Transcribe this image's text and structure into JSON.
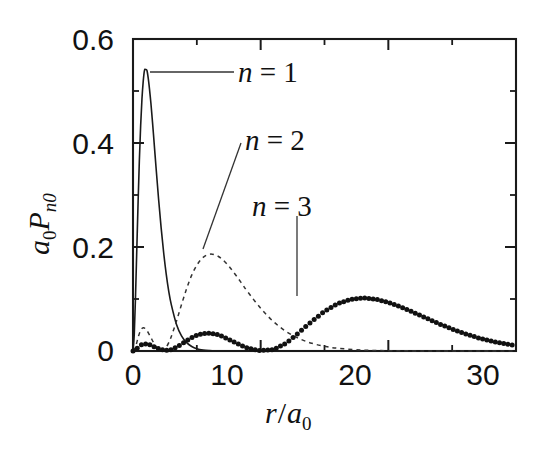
{
  "figure": {
    "kind": "scientific-plot",
    "background": "#ffffff",
    "ink_color": "#111111"
  },
  "chart_data": {
    "type": "line",
    "title": "",
    "subtitle": "",
    "xlabel": "r/a_0",
    "xlabel_parts": {
      "var": "r",
      "slash": "/",
      "base": "a",
      "sub": "0"
    },
    "ylabel": "a_0 P_n0",
    "ylabel_parts": {
      "base": "a",
      "base_sub": "0",
      "p": "P",
      "p_sub": "n0"
    },
    "xlim": [
      0,
      30
    ],
    "ylim": [
      0,
      0.6
    ],
    "grid": false,
    "legend_position": "inline-annotations",
    "x_major_ticks": [
      0,
      10,
      20,
      30
    ],
    "x_major_tick_labels": [
      "0",
      "10",
      "20",
      "30"
    ],
    "x_minor_ticks": [
      5,
      15,
      25
    ],
    "y_major_ticks": [
      0,
      0.2,
      0.4,
      0.6
    ],
    "y_major_tick_labels": [
      "0",
      "0.2",
      "0.4",
      "0.6"
    ],
    "y_minor_ticks": [
      0.1,
      0.3,
      0.5
    ],
    "annotations": [
      {
        "text": "n = 1",
        "n": 1,
        "leader": "horizontal",
        "points_to_r": 1.05,
        "points_to_value": 0.535
      },
      {
        "text": "n = 2",
        "n": 2,
        "leader": "diagonal",
        "points_to_r": 5.4,
        "points_to_value": 0.185
      },
      {
        "text": "n = 3",
        "n": 3,
        "leader": "vertical",
        "points_to_r": 12.8,
        "points_to_value": 0.105
      }
    ],
    "series": [
      {
        "name": "n = 1",
        "label": "n = 1",
        "style": "solid",
        "peak_r": 1.0,
        "peak_value": 0.541,
        "x": [
          0,
          0.1,
          0.2,
          0.3,
          0.4,
          0.5,
          0.6,
          0.7,
          0.8,
          0.9,
          1.0,
          1.1,
          1.2,
          1.3,
          1.4,
          1.5,
          1.6,
          1.8,
          2.0,
          2.2,
          2.4,
          2.6,
          2.8,
          3.0,
          3.4,
          3.8,
          4.2,
          4.6,
          5.0,
          5.5,
          6.0,
          6.5,
          7.0,
          8.0,
          9.0,
          10.0,
          12.0,
          15.0,
          20.0,
          25.0,
          30.0
        ],
        "y": [
          0.0,
          0.0327,
          0.1072,
          0.1976,
          0.2875,
          0.3679,
          0.4339,
          0.484,
          0.5186,
          0.5397,
          0.5413,
          0.5391,
          0.5232,
          0.5018,
          0.4773,
          0.4481,
          0.4177,
          0.3543,
          0.2933,
          0.2378,
          0.1894,
          0.1484,
          0.1147,
          0.0892,
          0.0516,
          0.0291,
          0.0161,
          0.0087,
          0.0045,
          0.002,
          0.0009,
          0.0004,
          0.0002,
          0.0,
          0.0,
          0.0,
          0.0,
          0.0,
          0.0,
          0.0,
          0.0
        ]
      },
      {
        "name": "n = 2",
        "label": "n = 2",
        "style": "dashed",
        "peak_r": 5.2,
        "peak_value": 0.186,
        "secondary_peak_r": 0.75,
        "secondary_peak_value": 0.045,
        "node_r": 2.0,
        "x": [
          0,
          0.2,
          0.4,
          0.6,
          0.8,
          1.0,
          1.2,
          1.4,
          1.6,
          1.8,
          2.0,
          2.2,
          2.4,
          2.6,
          2.8,
          3.0,
          3.4,
          3.8,
          4.2,
          4.6,
          5.0,
          5.4,
          5.8,
          6.2,
          6.6,
          7.0,
          7.5,
          8.0,
          8.5,
          9.0,
          10.0,
          11.0,
          12.0,
          13.0,
          14.0,
          15.0,
          16.0,
          18.0,
          20.0,
          22.0,
          25.0,
          30.0
        ],
        "y": [
          0.0,
          0.0081,
          0.026,
          0.04,
          0.0447,
          0.0421,
          0.035,
          0.0259,
          0.0166,
          0.0086,
          0.0027,
          0.0002,
          0.0016,
          0.007,
          0.016,
          0.0278,
          0.057,
          0.0893,
          0.1199,
          0.1459,
          0.165,
          0.178,
          0.1849,
          0.1862,
          0.183,
          0.1762,
          0.1635,
          0.1477,
          0.1307,
          0.1133,
          0.0821,
          0.0566,
          0.0375,
          0.024,
          0.0149,
          0.0091,
          0.0054,
          0.0018,
          0.0006,
          0.0002,
          0.0,
          0.0
        ]
      },
      {
        "name": "n = 3",
        "label": "n = 3",
        "style": "dotted",
        "peak_r": 13.0,
        "peak_value": 0.102,
        "secondary_peak_r": 4.3,
        "secondary_peak_value": 0.038,
        "tertiary_peak_r": 1.1,
        "tertiary_peak_value": 0.013,
        "node_r": [
          2.1,
          7.6
        ],
        "x": [
          0,
          0.3,
          0.6,
          0.9,
          1.2,
          1.5,
          1.8,
          2.1,
          2.5,
          3.0,
          3.5,
          4.0,
          4.5,
          5.0,
          5.5,
          6.0,
          6.5,
          7.0,
          7.5,
          8.0,
          8.5,
          9.0,
          9.5,
          10.0,
          11.0,
          12.0,
          13.0,
          14.0,
          15.0,
          16.0,
          17.0,
          18.0,
          19.0,
          20.0,
          21.0,
          22.0,
          23.0,
          24.0,
          25.0,
          26.0,
          27.0,
          28.0,
          29.0,
          30.0
        ],
        "y": [
          0.0,
          0.0047,
          0.0113,
          0.0137,
          0.0129,
          0.0101,
          0.0066,
          0.0035,
          0.0011,
          0.0027,
          0.0085,
          0.0164,
          0.0243,
          0.0303,
          0.0337,
          0.0344,
          0.0324,
          0.0282,
          0.0225,
          0.0162,
          0.0103,
          0.0056,
          0.0025,
          0.0008,
          0.0027,
          0.0152,
          0.0355,
          0.057,
          0.0762,
          0.0906,
          0.0993,
          0.1021,
          0.0998,
          0.0935,
          0.0845,
          0.074,
          0.0629,
          0.0521,
          0.0421,
          0.0332,
          0.0256,
          0.0194,
          0.0144,
          0.0105
        ]
      }
    ]
  },
  "axes": {
    "x_labels": [
      "0",
      "10",
      "20",
      "30"
    ],
    "y_labels": [
      "0.6",
      "0.4",
      "0.2",
      "0"
    ],
    "x_title": "r/a0",
    "y_title": "a0Pn0"
  },
  "labels": {
    "n1": {
      "var": "n",
      "eq": " = ",
      "val": "1"
    },
    "n2": {
      "var": "n",
      "eq": " = ",
      "val": "2"
    },
    "n3": {
      "var": "n",
      "eq": " = ",
      "val": "3"
    }
  }
}
